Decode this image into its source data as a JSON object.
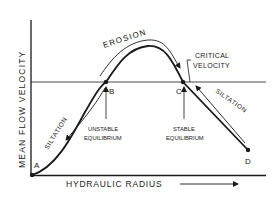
{
  "diagram": {
    "y_axis_label": "MEAN FLOW VELOCITY",
    "x_axis_label": "HYDRAULIC RADIUS",
    "curve_labels": {
      "erosion": "EROSION",
      "siltation_left": "SILTATION",
      "siltation_right": "SILTATION"
    },
    "critical_velocity_label": {
      "line1": "CRITICAL",
      "line2": "VELOCITY"
    },
    "points": {
      "a": "A",
      "b": "B",
      "c": "C",
      "d": "D"
    },
    "equilibrium_labels": {
      "unstable_line1": "UNSTABLE",
      "unstable_line2": "EQUILIBRIUM",
      "stable_line1": "STABLE",
      "stable_line2": "EQUILIBRIUM"
    },
    "colors": {
      "ink": "#1a1a1a",
      "background": "#ffffff"
    }
  }
}
